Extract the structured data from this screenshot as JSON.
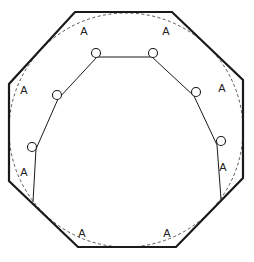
{
  "diagram": {
    "type": "geometric-figure",
    "colors": {
      "stroke": "#1a1a1a",
      "dashed": "#555555",
      "background": "#ffffff"
    },
    "octagon": {
      "points": [
        [
          75,
          12
        ],
        [
          172,
          12
        ],
        [
          243,
          80
        ],
        [
          243,
          178
        ],
        [
          176,
          247
        ],
        [
          78,
          247
        ],
        [
          9,
          181
        ],
        [
          9,
          84
        ]
      ]
    },
    "inscribed_circle": {
      "cx": 126,
      "cy": 130,
      "r": 117
    },
    "polyline": {
      "points": [
        [
          33,
          202
        ],
        [
          36,
          149
        ],
        [
          58,
          99
        ],
        [
          97,
          57
        ],
        [
          152,
          57
        ],
        [
          194,
          96
        ],
        [
          217,
          145
        ],
        [
          221,
          199
        ]
      ]
    },
    "markers": [
      {
        "cx": 96,
        "cy": 53,
        "r": 4.5
      },
      {
        "cx": 153,
        "cy": 53,
        "r": 4.5
      },
      {
        "cx": 57,
        "cy": 95,
        "r": 4.5
      },
      {
        "cx": 196,
        "cy": 92,
        "r": 4.5
      },
      {
        "cx": 32,
        "cy": 147,
        "r": 4.5
      },
      {
        "cx": 221,
        "cy": 141,
        "r": 4.5
      }
    ],
    "labels": [
      {
        "text": "A",
        "x": 84,
        "y": 35
      },
      {
        "text": "A",
        "x": 166,
        "y": 35
      },
      {
        "text": "A",
        "x": 24,
        "y": 94
      },
      {
        "text": "A",
        "x": 222,
        "y": 92
      },
      {
        "text": "A",
        "x": 24,
        "y": 176
      },
      {
        "text": "A",
        "x": 223,
        "y": 171
      },
      {
        "text": "A",
        "x": 82,
        "y": 237
      },
      {
        "text": "A",
        "x": 167,
        "y": 237
      }
    ]
  }
}
